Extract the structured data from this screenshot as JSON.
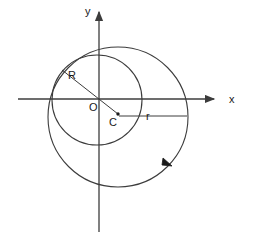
{
  "figure": {
    "background_color": "#ffffff",
    "stroke_color": "#3c3c3c",
    "text_color": "#1a1a1a"
  },
  "axes": {
    "x_label": "x",
    "y_label": "y",
    "origin_label": "O",
    "x_axis": {
      "x1": 18,
      "y1": 99,
      "x2": 218,
      "y2": 99
    },
    "y_axis": {
      "x1": 99,
      "y1": 8,
      "x2": 99,
      "y2": 232
    },
    "x_label_pos": {
      "x": 229,
      "y": 103
    },
    "y_label_pos": {
      "x": 85,
      "y": 14
    },
    "origin_label_pos": {
      "x": 89,
      "y": 111
    }
  },
  "shapes": {
    "small_circle": {
      "name": "inner circle centered at origin",
      "cx": 97,
      "cy": 100,
      "r": 45,
      "radius_symbol": "R"
    },
    "large_circle": {
      "name": "outer circle centered at C",
      "cx": 118,
      "cy": 117,
      "r": 70,
      "radius_symbol": "r",
      "direction_arrow": "counterclockwise"
    },
    "center_c": {
      "label": "C",
      "x": 118,
      "y": 114,
      "label_pos": {
        "x": 109,
        "y": 126
      }
    }
  },
  "annotations": {
    "R": {
      "label": "R",
      "label_pos": {
        "x": 70,
        "y": 76
      },
      "line": {
        "x1": 63,
        "y1": 71,
        "x2": 118,
        "y2": 114
      }
    },
    "r": {
      "label": "r",
      "label_pos": {
        "x": 147,
        "y": 120
      },
      "line": {
        "x1": 119,
        "y1": 116,
        "x2": 187,
        "y2": 116
      }
    },
    "direction_arrow_pos": {
      "x": 168,
      "y": 163
    }
  }
}
